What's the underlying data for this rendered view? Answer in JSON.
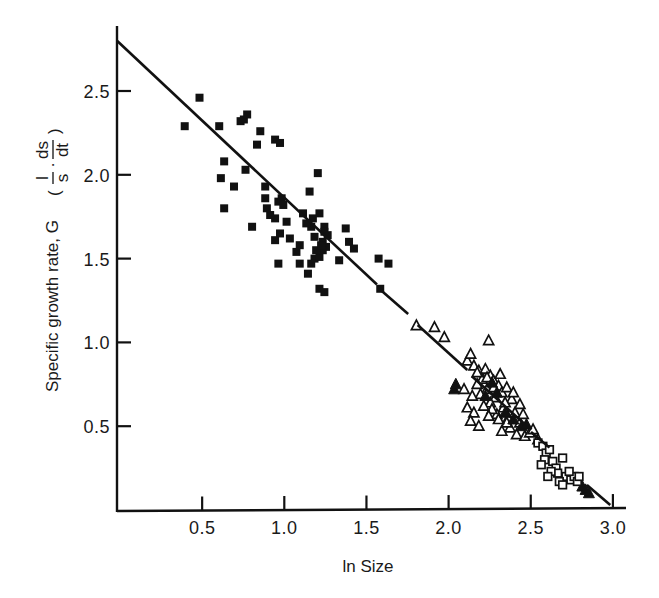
{
  "chart_data": {
    "type": "scatter",
    "title": "",
    "xlabel": "ln Size",
    "ylabel": "Specific growth rate, G",
    "ylabel_formula": {
      "open": "(",
      "frac1_num": "l",
      "frac1_den": "s",
      "dot": "·",
      "frac2_num": "ds",
      "frac2_den": "dt",
      "close": ")"
    },
    "xlim": [
      0,
      3.05
    ],
    "ylim": [
      0,
      2.85
    ],
    "xticks": [
      0.5,
      1.0,
      1.5,
      2.0,
      2.5,
      3.0
    ],
    "xtick_labels": [
      "0.5",
      "1.0",
      "1.5",
      "2.0",
      "2.5",
      "3.0"
    ],
    "yticks": [
      0.5,
      1.0,
      1.5,
      2.0,
      2.5
    ],
    "ytick_labels": [
      "0.5",
      "1.0",
      "1.5",
      "2.0",
      "2.5"
    ],
    "grid": false,
    "legend": null,
    "regression_line": {
      "x": [
        0,
        3.0
      ],
      "y": [
        2.8,
        0.02
      ],
      "style": "solid, with gaps near x≈1.6 and x≈1.8"
    },
    "series": [
      {
        "name": "filled squares",
        "marker": "filled-square",
        "points": [
          [
            0.4,
            2.29
          ],
          [
            0.49,
            2.46
          ],
          [
            0.61,
            2.29
          ],
          [
            0.62,
            1.98
          ],
          [
            0.64,
            2.08
          ],
          [
            0.7,
            1.93
          ],
          [
            0.64,
            1.8
          ],
          [
            0.74,
            2.32
          ],
          [
            0.76,
            2.33
          ],
          [
            0.78,
            2.36
          ],
          [
            0.77,
            2.03
          ],
          [
            0.86,
            2.26
          ],
          [
            0.84,
            2.18
          ],
          [
            0.81,
            1.69
          ],
          [
            0.95,
            2.21
          ],
          [
            0.98,
            2.19
          ],
          [
            0.89,
            1.86
          ],
          [
            0.89,
            1.93
          ],
          [
            0.95,
            1.74
          ],
          [
            0.92,
            1.76
          ],
          [
            0.9,
            1.8
          ],
          [
            0.97,
            1.84
          ],
          [
            0.99,
            1.86
          ],
          [
            1.0,
            1.82
          ],
          [
            0.98,
            1.65
          ],
          [
            0.95,
            1.61
          ],
          [
            0.97,
            1.47
          ],
          [
            1.02,
            1.72
          ],
          [
            1.1,
            1.47
          ],
          [
            1.15,
            1.41
          ],
          [
            1.16,
            1.9
          ],
          [
            1.21,
            2.01
          ],
          [
            1.18,
            1.74
          ],
          [
            1.22,
            1.77
          ],
          [
            1.25,
            1.69
          ],
          [
            1.17,
            1.69
          ],
          [
            1.24,
            1.6
          ],
          [
            1.19,
            1.5
          ],
          [
            1.22,
            1.51
          ],
          [
            1.17,
            1.47
          ],
          [
            1.26,
            1.57
          ],
          [
            1.24,
            1.55
          ],
          [
            1.27,
            1.64
          ],
          [
            1.22,
            1.32
          ],
          [
            1.25,
            1.3
          ],
          [
            1.34,
            1.49
          ],
          [
            1.38,
            1.68
          ],
          [
            1.4,
            1.6
          ],
          [
            1.43,
            1.56
          ],
          [
            1.58,
            1.5
          ],
          [
            1.64,
            1.47
          ],
          [
            1.59,
            1.32
          ],
          [
            1.08,
            1.54
          ],
          [
            1.1,
            1.58
          ],
          [
            1.19,
            1.63
          ],
          [
            1.25,
            1.66
          ],
          [
            1.04,
            1.62
          ],
          [
            1.14,
            1.71
          ],
          [
            1.12,
            1.77
          ],
          [
            1.2,
            1.55
          ],
          [
            1.23,
            1.58
          ]
        ]
      },
      {
        "name": "open triangles",
        "marker": "open-triangle",
        "points": [
          [
            1.81,
            1.1
          ],
          [
            1.92,
            1.09
          ],
          [
            1.98,
            1.03
          ],
          [
            2.25,
            1.01
          ],
          [
            2.12,
            0.89
          ],
          [
            2.14,
            0.93
          ],
          [
            2.16,
            0.86
          ],
          [
            2.19,
            0.83
          ],
          [
            2.23,
            0.84
          ],
          [
            2.26,
            0.8
          ],
          [
            2.21,
            0.78
          ],
          [
            2.18,
            0.75
          ],
          [
            2.28,
            0.77
          ],
          [
            2.31,
            0.74
          ],
          [
            2.24,
            0.72
          ],
          [
            2.2,
            0.69
          ],
          [
            2.33,
            0.7
          ],
          [
            2.36,
            0.73
          ],
          [
            2.29,
            0.67
          ],
          [
            2.26,
            0.64
          ],
          [
            2.39,
            0.66
          ],
          [
            2.15,
            0.68
          ],
          [
            2.12,
            0.61
          ],
          [
            2.16,
            0.58
          ],
          [
            2.14,
            0.53
          ],
          [
            2.1,
            0.72
          ],
          [
            2.34,
            0.61
          ],
          [
            2.3,
            0.57
          ],
          [
            2.37,
            0.55
          ],
          [
            2.41,
            0.58
          ],
          [
            2.44,
            0.52
          ],
          [
            2.38,
            0.49
          ],
          [
            2.33,
            0.47
          ],
          [
            2.42,
            0.45
          ],
          [
            2.47,
            0.44
          ],
          [
            2.5,
            0.46
          ],
          [
            2.27,
            0.6
          ],
          [
            2.22,
            0.62
          ],
          [
            2.35,
            0.64
          ],
          [
            2.4,
            0.7
          ],
          [
            2.28,
            0.73
          ],
          [
            2.24,
            0.79
          ],
          [
            2.32,
            0.81
          ],
          [
            2.18,
            0.82
          ],
          [
            2.44,
            0.63
          ],
          [
            2.46,
            0.57
          ],
          [
            2.52,
            0.48
          ],
          [
            2.55,
            0.42
          ],
          [
            2.36,
            0.52
          ],
          [
            2.31,
            0.54
          ],
          [
            2.25,
            0.56
          ],
          [
            2.19,
            0.5
          ]
        ]
      },
      {
        "name": "filled triangles",
        "marker": "filled-triangle",
        "points": [
          [
            2.04,
            0.72
          ],
          [
            2.05,
            0.75
          ],
          [
            2.23,
            0.68
          ],
          [
            2.3,
            0.7
          ],
          [
            2.27,
            0.76
          ],
          [
            2.35,
            0.58
          ],
          [
            2.4,
            0.54
          ],
          [
            2.45,
            0.5
          ],
          [
            2.48,
            0.51
          ],
          [
            2.82,
            0.14
          ],
          [
            2.84,
            0.12
          ],
          [
            2.86,
            0.1
          ]
        ]
      },
      {
        "name": "open squares",
        "marker": "open-square",
        "points": [
          [
            2.55,
            0.4
          ],
          [
            2.58,
            0.38
          ],
          [
            2.6,
            0.34
          ],
          [
            2.62,
            0.36
          ],
          [
            2.59,
            0.3
          ],
          [
            2.57,
            0.27
          ],
          [
            2.64,
            0.29
          ],
          [
            2.66,
            0.25
          ],
          [
            2.67,
            0.22
          ],
          [
            2.7,
            0.31
          ],
          [
            2.72,
            0.2
          ],
          [
            2.75,
            0.18
          ],
          [
            2.77,
            0.2
          ],
          [
            2.79,
            0.17
          ],
          [
            2.68,
            0.17
          ],
          [
            2.7,
            0.15
          ],
          [
            2.63,
            0.23
          ],
          [
            2.61,
            0.2
          ],
          [
            2.8,
            0.2
          ],
          [
            2.74,
            0.23
          ]
        ]
      }
    ]
  }
}
